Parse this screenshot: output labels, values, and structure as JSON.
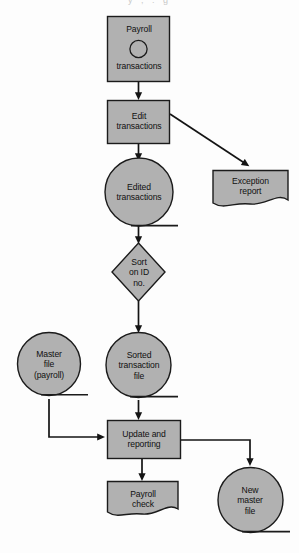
{
  "diagram": {
    "artifact_text": "y        ,                        .                 g",
    "colors": {
      "shape_fill": "#b1b1b1",
      "shape_stroke": "#1b1b1b",
      "connector": "#141414",
      "background": "#fdfdfd",
      "text": "#101010"
    },
    "nodes": [
      {
        "id": "payroll-transactions",
        "shape": "process-with-circle",
        "lines": [
          "Payroll",
          "transactions"
        ]
      },
      {
        "id": "edit-transactions",
        "shape": "process",
        "lines": [
          "Edit",
          "transactions"
        ]
      },
      {
        "id": "exception-report",
        "shape": "document",
        "lines": [
          "Exception",
          "report"
        ]
      },
      {
        "id": "edited-transactions",
        "shape": "magnetic-tape",
        "lines": [
          "Edited",
          "transactions"
        ]
      },
      {
        "id": "sort-on-id-no",
        "shape": "decision",
        "lines": [
          "Sort",
          "on ID",
          "no."
        ]
      },
      {
        "id": "master-file-payroll",
        "shape": "magnetic-tape",
        "lines": [
          "Master",
          "file",
          "(payroll)"
        ]
      },
      {
        "id": "sorted-transaction-file",
        "shape": "magnetic-tape",
        "lines": [
          "Sorted",
          "transaction",
          "file"
        ]
      },
      {
        "id": "update-and-reporting",
        "shape": "process",
        "lines": [
          "Update and",
          "reporting"
        ]
      },
      {
        "id": "payroll-check",
        "shape": "document",
        "lines": [
          "Payroll",
          "check"
        ]
      },
      {
        "id": "new-master-file",
        "shape": "magnetic-tape",
        "lines": [
          "New",
          "master",
          "file"
        ]
      }
    ],
    "edges": [
      {
        "from": "payroll-transactions",
        "to": "edit-transactions"
      },
      {
        "from": "edit-transactions",
        "to": "exception-report"
      },
      {
        "from": "edit-transactions",
        "to": "edited-transactions"
      },
      {
        "from": "edited-transactions",
        "to": "sort-on-id-no"
      },
      {
        "from": "sort-on-id-no",
        "to": "sorted-transaction-file"
      },
      {
        "from": "sorted-transaction-file",
        "to": "update-and-reporting"
      },
      {
        "from": "master-file-payroll",
        "to": "update-and-reporting"
      },
      {
        "from": "update-and-reporting",
        "to": "payroll-check"
      },
      {
        "from": "update-and-reporting",
        "to": "new-master-file"
      }
    ]
  }
}
